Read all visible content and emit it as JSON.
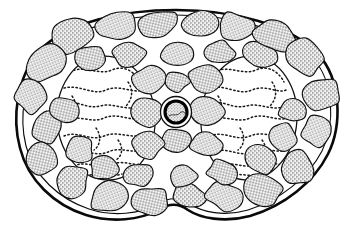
{
  "figure": {
    "kind": "biological-illustration",
    "caption": "",
    "background_color": "#ffffff",
    "ink_color": "#101010",
    "stipple_color": "#2a2a2a",
    "canvas": {
      "width": 354,
      "height": 235
    }
  },
  "structures": {
    "outer_wall": {
      "name": "seed coat outline",
      "label": "",
      "stroke_color": "#0a0a0a",
      "double_line": true,
      "outer_width": 2.4,
      "inner_width": 1.1,
      "shape": "kidney-bean with bottom notch"
    },
    "cortex": {
      "name": "stippled parenchyma cell ring",
      "label": "",
      "cell_count": 46,
      "fill": "stipple"
    },
    "cotyledons": [
      {
        "name": "left cotyledon",
        "label": "",
        "fill": "#ffffff",
        "pattern": "dotted squiggles"
      },
      {
        "name": "right cotyledon",
        "label": "",
        "fill": "#ffffff",
        "pattern": "dotted squiggles"
      }
    ],
    "vascular_bundle": {
      "name": "central vascular element",
      "label": "",
      "ring_color": "#000000",
      "lumen_color": "#f2f2f2",
      "cx": 176,
      "cy": 112,
      "r_outer": 15.5,
      "r_inner": 11.5
    }
  },
  "cortex_cells": [
    {
      "cx": 73,
      "cy": 35,
      "rx": 24,
      "ry": 16,
      "rot": -24,
      "seed": 1
    },
    {
      "cx": 116,
      "cy": 26,
      "rx": 20,
      "ry": 14,
      "rot": -10,
      "seed": 2
    },
    {
      "cx": 157,
      "cy": 23,
      "rx": 22,
      "ry": 13,
      "rot": -3,
      "seed": 3
    },
    {
      "cx": 199,
      "cy": 23,
      "rx": 19,
      "ry": 12,
      "rot": 4,
      "seed": 4
    },
    {
      "cx": 236,
      "cy": 27,
      "rx": 20,
      "ry": 14,
      "rot": 10,
      "seed": 5
    },
    {
      "cx": 275,
      "cy": 36,
      "rx": 22,
      "ry": 15,
      "rot": 22,
      "seed": 6
    },
    {
      "cx": 305,
      "cy": 57,
      "rx": 20,
      "ry": 16,
      "rot": 40,
      "seed": 7
    },
    {
      "cx": 47,
      "cy": 62,
      "rx": 21,
      "ry": 17,
      "rot": -46,
      "seed": 8
    },
    {
      "cx": 90,
      "cy": 58,
      "rx": 17,
      "ry": 12,
      "rot": -18,
      "seed": 9
    },
    {
      "cx": 129,
      "cy": 54,
      "rx": 16,
      "ry": 12,
      "rot": -6,
      "seed": 10
    },
    {
      "cx": 177,
      "cy": 53,
      "rx": 17,
      "ry": 12,
      "rot": 0,
      "seed": 11
    },
    {
      "cx": 219,
      "cy": 52,
      "rx": 16,
      "ry": 12,
      "rot": 6,
      "seed": 12
    },
    {
      "cx": 259,
      "cy": 55,
      "rx": 17,
      "ry": 13,
      "rot": 18,
      "seed": 13
    },
    {
      "cx": 31,
      "cy": 96,
      "rx": 17,
      "ry": 18,
      "rot": -70,
      "seed": 14
    },
    {
      "cx": 47,
      "cy": 128,
      "rx": 16,
      "ry": 15,
      "rot": -85,
      "seed": 15
    },
    {
      "cx": 322,
      "cy": 94,
      "rx": 16,
      "ry": 18,
      "rot": 70,
      "seed": 16
    },
    {
      "cx": 318,
      "cy": 131,
      "rx": 16,
      "ry": 16,
      "rot": 85,
      "seed": 17
    },
    {
      "cx": 42,
      "cy": 160,
      "rx": 18,
      "ry": 15,
      "rot": -60,
      "seed": 18
    },
    {
      "cx": 72,
      "cy": 182,
      "rx": 19,
      "ry": 15,
      "rot": -38,
      "seed": 19
    },
    {
      "cx": 109,
      "cy": 196,
      "rx": 20,
      "ry": 15,
      "rot": -20,
      "seed": 20
    },
    {
      "cx": 150,
      "cy": 201,
      "rx": 19,
      "ry": 14,
      "rot": -8,
      "seed": 21
    },
    {
      "cx": 188,
      "cy": 196,
      "rx": 17,
      "ry": 13,
      "rot": 4,
      "seed": 22
    },
    {
      "cx": 225,
      "cy": 196,
      "rx": 19,
      "ry": 14,
      "rot": 12,
      "seed": 23
    },
    {
      "cx": 263,
      "cy": 190,
      "rx": 20,
      "ry": 15,
      "rot": 26,
      "seed": 24
    },
    {
      "cx": 298,
      "cy": 168,
      "rx": 19,
      "ry": 16,
      "rot": 46,
      "seed": 25
    },
    {
      "cx": 80,
      "cy": 150,
      "rx": 15,
      "ry": 13,
      "rot": -40,
      "seed": 26
    },
    {
      "cx": 104,
      "cy": 168,
      "rx": 15,
      "ry": 12,
      "rot": -24,
      "seed": 27
    },
    {
      "cx": 140,
      "cy": 175,
      "rx": 15,
      "ry": 12,
      "rot": -10,
      "seed": 28
    },
    {
      "cx": 183,
      "cy": 176,
      "rx": 15,
      "ry": 12,
      "rot": 0,
      "seed": 29
    },
    {
      "cx": 222,
      "cy": 172,
      "rx": 15,
      "ry": 12,
      "rot": 10,
      "seed": 30
    },
    {
      "cx": 260,
      "cy": 160,
      "rx": 16,
      "ry": 13,
      "rot": 30,
      "seed": 31
    },
    {
      "cx": 283,
      "cy": 137,
      "rx": 15,
      "ry": 13,
      "rot": 52,
      "seed": 32
    },
    {
      "cx": 64,
      "cy": 110,
      "rx": 12,
      "ry": 14,
      "rot": -80,
      "seed": 33
    },
    {
      "cx": 293,
      "cy": 110,
      "rx": 12,
      "ry": 14,
      "rot": 80,
      "seed": 34
    },
    {
      "cx": 148,
      "cy": 80,
      "rx": 17,
      "ry": 14,
      "rot": -4,
      "seed": 35
    },
    {
      "cx": 205,
      "cy": 80,
      "rx": 17,
      "ry": 14,
      "rot": 4,
      "seed": 36
    },
    {
      "cx": 147,
      "cy": 112,
      "rx": 17,
      "ry": 14,
      "rot": 0,
      "seed": 37
    },
    {
      "cx": 207,
      "cy": 112,
      "rx": 17,
      "ry": 15,
      "rot": 0,
      "seed": 38
    },
    {
      "cx": 176,
      "cy": 140,
      "rx": 15,
      "ry": 11,
      "rot": 0,
      "seed": 39
    },
    {
      "cx": 148,
      "cy": 145,
      "rx": 16,
      "ry": 13,
      "rot": -4,
      "seed": 40
    },
    {
      "cx": 206,
      "cy": 144,
      "rx": 16,
      "ry": 13,
      "rot": 4,
      "seed": 41
    },
    {
      "cx": 176,
      "cy": 82,
      "rx": 13,
      "ry": 10,
      "rot": 0,
      "seed": 42
    }
  ],
  "cotyledon_shapes": [
    {
      "name": "left",
      "cx": 106,
      "cy": 118,
      "rx": 49,
      "ry": 62,
      "rot": -4
    },
    {
      "name": "right",
      "cx": 249,
      "cy": 118,
      "rx": 48,
      "ry": 62,
      "rot": 4
    }
  ]
}
